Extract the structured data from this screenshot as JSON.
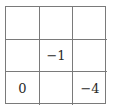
{
  "grid": {
    "rows": 3,
    "cols": 3,
    "line_color": "#7a7a7a",
    "cells": [
      [
        "",
        "",
        ""
      ],
      [
        "",
        "−1",
        ""
      ],
      [
        "0",
        "",
        "−4"
      ]
    ]
  }
}
